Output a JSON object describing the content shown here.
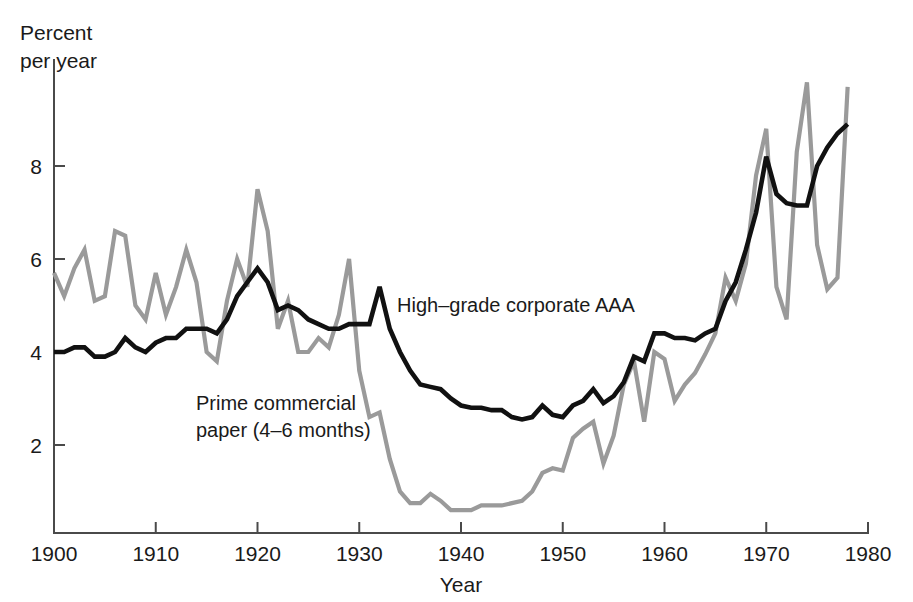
{
  "chart_data": {
    "type": "line",
    "title": "",
    "xlabel": "Year",
    "ylabel": "Percent per year",
    "ylabel_line1": "Percent",
    "ylabel_line2": "per year",
    "xlim": [
      1900,
      1980
    ],
    "ylim": [
      0,
      10
    ],
    "grid": false,
    "legend_position": "inline-annotations",
    "xticks": [
      1900,
      1910,
      1920,
      1930,
      1940,
      1950,
      1960,
      1970,
      1980
    ],
    "xticklabels": [
      "1900",
      "1910",
      "1920",
      "1930",
      "1940",
      "1950",
      "1960",
      "1970",
      "1980"
    ],
    "yticks": [
      2,
      4,
      6,
      8
    ],
    "yticklabels": [
      "2",
      "4",
      "6",
      "8"
    ],
    "colors": {
      "aaa": "#111111",
      "commercial_paper": "#9a9a9a",
      "axis": "#4a4a4a",
      "background": "#ffffff"
    },
    "annotations": [
      {
        "text": "High–grade corporate AAA",
        "series": "High–grade corporate AAA",
        "x": 1934.5,
        "y": 4.75
      },
      {
        "text_line1": "Prime commercial",
        "text_line2": "paper (4–6 months)",
        "series": "Prime commercial paper (4–6 months)",
        "x": 1914,
        "y": 3.1
      }
    ],
    "x": [
      1900,
      1901,
      1902,
      1903,
      1904,
      1905,
      1906,
      1907,
      1908,
      1909,
      1910,
      1911,
      1912,
      1913,
      1914,
      1915,
      1916,
      1917,
      1918,
      1919,
      1920,
      1921,
      1922,
      1923,
      1924,
      1925,
      1926,
      1927,
      1928,
      1929,
      1930,
      1931,
      1932,
      1933,
      1934,
      1935,
      1936,
      1937,
      1938,
      1939,
      1940,
      1941,
      1942,
      1943,
      1944,
      1945,
      1946,
      1947,
      1948,
      1949,
      1950,
      1951,
      1952,
      1953,
      1954,
      1955,
      1956,
      1957,
      1958,
      1959,
      1960,
      1961,
      1962,
      1963,
      1964,
      1965,
      1966,
      1967,
      1968,
      1969,
      1970,
      1971,
      1972,
      1973,
      1974,
      1975,
      1976,
      1977,
      1978
    ],
    "series": [
      {
        "name": "Prime commercial paper (4–6 months)",
        "color": "#9a9a9a",
        "values": [
          5.7,
          5.2,
          5.8,
          6.2,
          5.1,
          5.2,
          6.6,
          6.5,
          5.0,
          4.7,
          5.7,
          4.8,
          5.4,
          6.2,
          5.5,
          4.0,
          3.8,
          5.1,
          6.0,
          5.4,
          7.5,
          6.6,
          4.5,
          5.1,
          4.0,
          4.0,
          4.3,
          4.1,
          4.8,
          6.0,
          3.6,
          2.6,
          2.7,
          1.7,
          1.0,
          0.75,
          0.75,
          0.95,
          0.8,
          0.6,
          0.6,
          0.6,
          0.7,
          0.7,
          0.7,
          0.75,
          0.8,
          1.0,
          1.4,
          1.5,
          1.45,
          2.15,
          2.35,
          2.5,
          1.6,
          2.2,
          3.3,
          3.8,
          2.5,
          4.0,
          3.85,
          2.95,
          3.3,
          3.55,
          3.95,
          4.4,
          5.6,
          5.1,
          5.9,
          7.8,
          8.8,
          5.4,
          4.7,
          8.3,
          9.8,
          6.3,
          5.35,
          5.6,
          9.7
        ]
      },
      {
        "name": "High–grade corporate AAA",
        "color": "#111111",
        "values": [
          4.0,
          4.0,
          4.1,
          4.1,
          3.9,
          3.9,
          4.0,
          4.3,
          4.1,
          4.0,
          4.2,
          4.3,
          4.3,
          4.5,
          4.5,
          4.5,
          4.4,
          4.7,
          5.2,
          5.5,
          5.8,
          5.5,
          4.9,
          5.0,
          4.9,
          4.7,
          4.6,
          4.5,
          4.5,
          4.6,
          4.6,
          4.6,
          5.4,
          4.5,
          4.0,
          3.6,
          3.3,
          3.25,
          3.2,
          3.0,
          2.85,
          2.8,
          2.8,
          2.75,
          2.75,
          2.6,
          2.55,
          2.6,
          2.85,
          2.65,
          2.6,
          2.85,
          2.95,
          3.2,
          2.9,
          3.05,
          3.35,
          3.9,
          3.8,
          4.4,
          4.4,
          4.3,
          4.3,
          4.25,
          4.4,
          4.5,
          5.1,
          5.5,
          6.2,
          7.0,
          8.2,
          7.4,
          7.2,
          7.15,
          7.15,
          8.0,
          8.4,
          8.7,
          8.9
        ]
      }
    ]
  }
}
